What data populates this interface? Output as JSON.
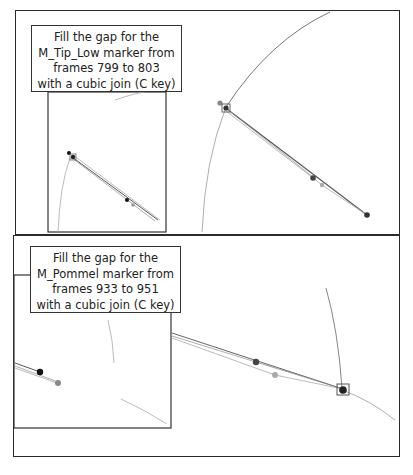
{
  "panels": [
    {
      "id": "top",
      "instruction": "Fill the gap for the\nM_Tip_Low marker from\nframes 799 to 803\nwith a cubic join (C key)",
      "marker": "M_Tip_Low",
      "frame_start": 799,
      "frame_end": 803,
      "join": "cubic",
      "shortcut_key": "C"
    },
    {
      "id": "bottom",
      "instruction": "Fill the gap for the\nM_Pommel marker from\nframes 933 to 951\nwith a cubic join (C key)",
      "marker": "M_Pommel",
      "frame_start": 933,
      "frame_end": 951,
      "join": "cubic",
      "shortcut_key": "C"
    }
  ],
  "colors": {
    "border": "#2a2a2a",
    "trajectory": "#999999",
    "marker_dark": "#333333",
    "marker_black": "#111111",
    "marker_gray": "#888888",
    "marker_light": "#aaaaaa"
  }
}
